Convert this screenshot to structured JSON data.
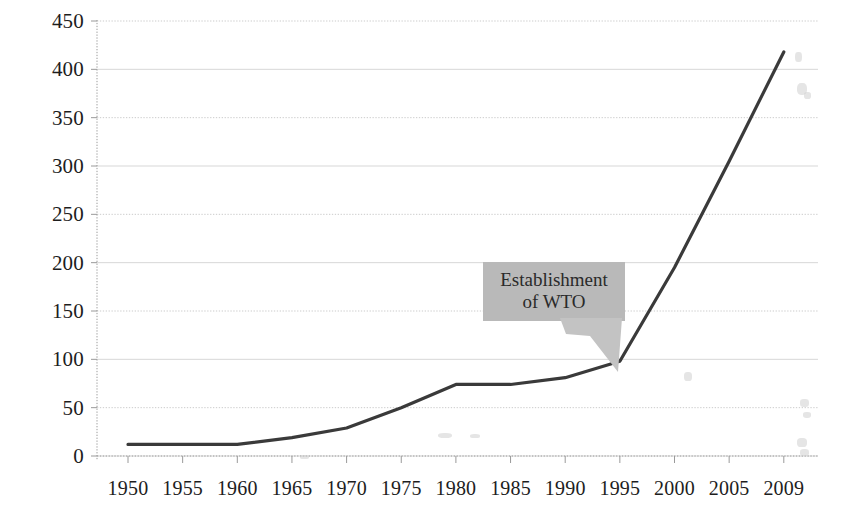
{
  "chart_data": {
    "type": "line",
    "title": "",
    "xlabel": "",
    "ylabel": "",
    "categories": [
      "1950",
      "1955",
      "1960",
      "1965",
      "1970",
      "1975",
      "1980",
      "1985",
      "1990",
      "1995",
      "2000",
      "2005",
      "2009"
    ],
    "values": [
      12,
      12,
      12,
      19,
      29,
      50,
      74,
      74,
      81,
      98,
      195,
      305,
      418
    ],
    "ylim": [
      0,
      450
    ],
    "ytick_step": 50,
    "yticks": [
      "0",
      "50",
      "100",
      "150",
      "200",
      "250",
      "300",
      "350",
      "400",
      "450"
    ],
    "xticks": [
      "1950",
      "1955",
      "1960",
      "1965",
      "1970",
      "1975",
      "1980",
      "1985",
      "1990",
      "1995",
      "2000",
      "2005",
      "2009"
    ],
    "grid": true,
    "grid_style": "dotted-horizontal",
    "legend": "none",
    "series_color": "#3a3a3a",
    "annotations": [
      {
        "name": "establishment-of-wto",
        "lines": [
          "Establishment",
          "of WTO"
        ],
        "text": "Establishment of WTO",
        "points_at_category": "1995",
        "points_at_value": 98,
        "box_color": "#b9b9b9",
        "text_color": "#2a2a2a"
      }
    ]
  },
  "axes": {
    "axis_color": "#9a9a9a",
    "grid_color": "#c9c9c9",
    "label_color": "#1d1d1d"
  }
}
